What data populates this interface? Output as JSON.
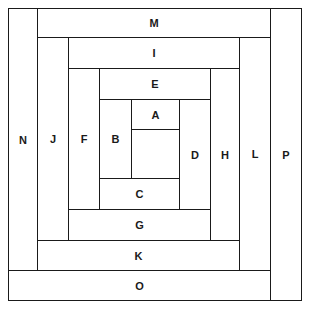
{
  "diagram": {
    "type": "log-cabin-quilt-block",
    "pieces": [
      {
        "label": "N",
        "x": 8,
        "y": 8,
        "w": 30,
        "h": 263
      },
      {
        "label": "M",
        "x": 37,
        "y": 8,
        "w": 234,
        "h": 30
      },
      {
        "label": "P",
        "x": 270,
        "y": 8,
        "w": 32,
        "h": 293
      },
      {
        "label": "O",
        "x": 8,
        "y": 270,
        "w": 263,
        "h": 31
      },
      {
        "label": "J",
        "x": 37,
        "y": 37,
        "w": 32,
        "h": 204
      },
      {
        "label": "I",
        "x": 68,
        "y": 37,
        "w": 172,
        "h": 32
      },
      {
        "label": "L",
        "x": 239,
        "y": 37,
        "w": 32,
        "h": 234
      },
      {
        "label": "K",
        "x": 37,
        "y": 240,
        "w": 203,
        "h": 31
      },
      {
        "label": "F",
        "x": 68,
        "y": 68,
        "w": 32,
        "h": 142
      },
      {
        "label": "E",
        "x": 99,
        "y": 68,
        "w": 112,
        "h": 32
      },
      {
        "label": "H",
        "x": 210,
        "y": 68,
        "w": 30,
        "h": 173
      },
      {
        "label": "G",
        "x": 68,
        "y": 209,
        "w": 143,
        "h": 32
      },
      {
        "label": "B",
        "x": 99,
        "y": 99,
        "w": 33,
        "h": 80
      },
      {
        "label": "A",
        "x": 131,
        "y": 99,
        "w": 49,
        "h": 31
      },
      {
        "label": "D",
        "x": 179,
        "y": 99,
        "w": 32,
        "h": 111
      },
      {
        "label": "C",
        "x": 99,
        "y": 178,
        "w": 81,
        "h": 32
      },
      {
        "label": "",
        "x": 131,
        "y": 129,
        "w": 49,
        "h": 50
      }
    ]
  }
}
